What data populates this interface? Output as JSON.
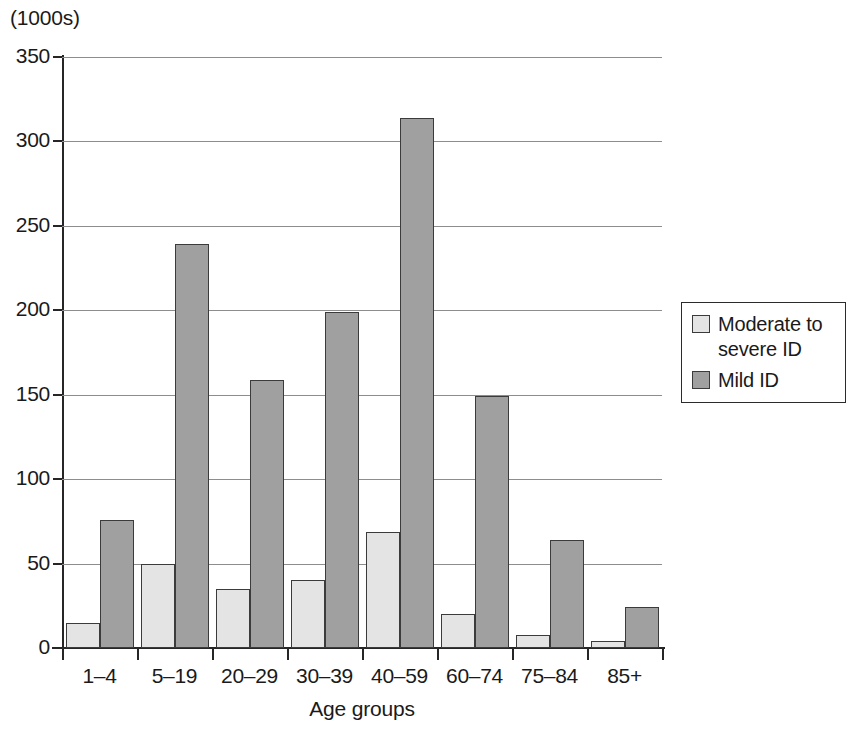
{
  "chart_data": {
    "type": "bar",
    "title": "",
    "subtitle": "",
    "unit_label": "(1000s)",
    "xlabel": "Age groups",
    "ylabel": "",
    "categories": [
      "1–4",
      "5–19",
      "20–29",
      "30–39",
      "40–59",
      "60–74",
      "75–84",
      "85+"
    ],
    "series": [
      {
        "name": "Moderate to severe ID",
        "color": "#e4e4e4",
        "values": [
          15,
          50,
          35,
          40,
          69,
          20,
          8,
          4
        ]
      },
      {
        "name": "Mild ID",
        "color": "#a0a0a0",
        "values": [
          76,
          239,
          159,
          199,
          314,
          149,
          64,
          24
        ]
      }
    ],
    "ylim": [
      0,
      350
    ],
    "yticks": [
      0,
      50,
      100,
      150,
      200,
      250,
      300,
      350
    ],
    "ytick_labels": [
      "0",
      "50",
      "100",
      "150",
      "200",
      "250",
      "300",
      "350"
    ],
    "grid": true,
    "grid_axis": "y",
    "legend_position": "right"
  },
  "legend": {
    "entries": [
      {
        "label": "Moderate to severe ID",
        "swatch": "moderate"
      },
      {
        "label": "Mild ID",
        "swatch": "mild"
      }
    ]
  },
  "colors": {
    "moderate": "#e4e4e4",
    "mild": "#a0a0a0",
    "axis": "#262626",
    "gridline": "#8d8d8d",
    "bar_outline": "#3b3b3b"
  }
}
